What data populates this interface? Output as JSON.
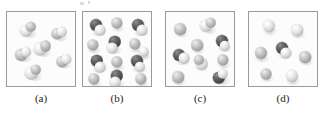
{
  "figure": {
    "width": 323,
    "height": 113,
    "background": "#ffffff",
    "border_color": "#9a9a9a",
    "panel_background": "#fcfcfc",
    "atom_colors": {
      "light": "#e8e8e8",
      "gray": "#b6b6b6",
      "dark": "#4e4e4e"
    },
    "top_artifact": "cut-off text remnant"
  },
  "panels": [
    {
      "id": "panel-a",
      "label": "(a)",
      "x": 6,
      "y": 11,
      "w": 70,
      "h": 76,
      "label_x": 6,
      "label_w": 70,
      "label_y": 92,
      "molecules": [
        {
          "type": "diatomic-light-light",
          "atoms": [
            {
              "cx": 19,
              "cy": 19,
              "r": 6.2,
              "shade": "light"
            },
            {
              "cx": 23.5,
              "cy": 15,
              "r": 5.2,
              "shade": "gray"
            }
          ]
        },
        {
          "type": "diatomic-light-light",
          "atoms": [
            {
              "cx": 50,
              "cy": 22,
              "r": 5.6,
              "shade": "gray"
            },
            {
              "cx": 55,
              "cy": 20,
              "r": 5.2,
              "shade": "light"
            }
          ]
        },
        {
          "type": "diatomic-light-light",
          "atoms": [
            {
              "cx": 14,
              "cy": 43,
              "r": 6.0,
              "shade": "gray"
            },
            {
              "cx": 19,
              "cy": 40,
              "r": 5.0,
              "shade": "light"
            }
          ]
        },
        {
          "type": "diatomic-light-light",
          "atoms": [
            {
              "cx": 33,
              "cy": 37,
              "r": 6.4,
              "shade": "light"
            },
            {
              "cx": 38.5,
              "cy": 34,
              "r": 5.4,
              "shade": "gray"
            }
          ]
        },
        {
          "type": "diatomic-light-light",
          "atoms": [
            {
              "cx": 55,
              "cy": 50,
              "r": 5.6,
              "shade": "gray"
            },
            {
              "cx": 59,
              "cy": 47,
              "r": 4.8,
              "shade": "light"
            }
          ]
        },
        {
          "type": "diatomic-light-light",
          "atoms": [
            {
              "cx": 24,
              "cy": 61,
              "r": 6.4,
              "shade": "light"
            },
            {
              "cx": 29,
              "cy": 58,
              "r": 5.2,
              "shade": "gray"
            }
          ]
        }
      ]
    },
    {
      "id": "panel-b",
      "label": "(b)",
      "x": 82,
      "y": 11,
      "w": 70,
      "h": 76,
      "label_x": 82,
      "label_w": 70,
      "label_y": 92,
      "molecules": [
        {
          "type": "diatomic-dark-light",
          "atoms": [
            {
              "cx": 13,
              "cy": 13,
              "r": 6.0,
              "shade": "dark"
            },
            {
              "cx": 17,
              "cy": 18,
              "r": 5.4,
              "shade": "light"
            }
          ]
        },
        {
          "type": "monatomic-light",
          "atoms": [
            {
              "cx": 34,
              "cy": 11,
              "r": 5.6,
              "shade": "gray"
            }
          ]
        },
        {
          "type": "diatomic-dark-light",
          "atoms": [
            {
              "cx": 55,
              "cy": 13,
              "r": 6.0,
              "shade": "dark"
            },
            {
              "cx": 59,
              "cy": 18,
              "r": 5.4,
              "shade": "light"
            }
          ]
        },
        {
          "type": "monatomic-light",
          "atoms": [
            {
              "cx": 10,
              "cy": 33,
              "r": 5.6,
              "shade": "gray"
            }
          ]
        },
        {
          "type": "diatomic-dark-light",
          "atoms": [
            {
              "cx": 32,
              "cy": 30,
              "r": 6.2,
              "shade": "dark"
            },
            {
              "cx": 29,
              "cy": 36,
              "r": 5.4,
              "shade": "light"
            }
          ]
        },
        {
          "type": "monatomic-light",
          "atoms": [
            {
              "cx": 52,
              "cy": 32,
              "r": 5.6,
              "shade": "gray"
            }
          ]
        },
        {
          "type": "monatomic-light",
          "atoms": [
            {
              "cx": 61,
              "cy": 40,
              "r": 5.2,
              "shade": "light"
            }
          ]
        },
        {
          "type": "diatomic-dark-light",
          "atoms": [
            {
              "cx": 14,
              "cy": 49,
              "r": 6.2,
              "shade": "dark"
            },
            {
              "cx": 17,
              "cy": 55,
              "r": 5.4,
              "shade": "light"
            }
          ]
        },
        {
          "type": "monatomic-light",
          "atoms": [
            {
              "cx": 34,
              "cy": 50,
              "r": 5.6,
              "shade": "gray"
            }
          ]
        },
        {
          "type": "diatomic-dark-light",
          "atoms": [
            {
              "cx": 54,
              "cy": 49,
              "r": 6.0,
              "shade": "dark"
            },
            {
              "cx": 57,
              "cy": 55,
              "r": 5.2,
              "shade": "light"
            }
          ]
        },
        {
          "type": "diatomic-dark-light",
          "atoms": [
            {
              "cx": 34,
              "cy": 64,
              "r": 6.2,
              "shade": "dark"
            },
            {
              "cx": 32,
              "cy": 70,
              "r": 5.4,
              "shade": "light"
            }
          ]
        },
        {
          "type": "monatomic-light",
          "atoms": [
            {
              "cx": 11,
              "cy": 67,
              "r": 5.6,
              "shade": "gray"
            }
          ]
        },
        {
          "type": "monatomic-light",
          "atoms": [
            {
              "cx": 58,
              "cy": 67,
              "r": 5.6,
              "shade": "gray"
            }
          ]
        }
      ]
    },
    {
      "id": "panel-c",
      "label": "(c)",
      "x": 165,
      "y": 11,
      "w": 70,
      "h": 76,
      "label_x": 165,
      "label_w": 70,
      "label_y": 92,
      "molecules": [
        {
          "type": "monatomic-light",
          "atoms": [
            {
              "cx": 14,
              "cy": 17,
              "r": 5.8,
              "shade": "gray"
            }
          ]
        },
        {
          "type": "diatomic-light-light",
          "atoms": [
            {
              "cx": 40,
              "cy": 14,
              "r": 6.2,
              "shade": "light"
            },
            {
              "cx": 45,
              "cy": 11,
              "r": 5.2,
              "shade": "gray"
            }
          ]
        },
        {
          "type": "monatomic-light",
          "atoms": [
            {
              "cx": 31,
              "cy": 33,
              "r": 5.8,
              "shade": "gray"
            }
          ]
        },
        {
          "type": "diatomic-dark-light",
          "atoms": [
            {
              "cx": 56,
              "cy": 29,
              "r": 6.0,
              "shade": "dark"
            },
            {
              "cx": 59,
              "cy": 34,
              "r": 5.2,
              "shade": "light"
            }
          ]
        },
        {
          "type": "diatomic-dark-light",
          "atoms": [
            {
              "cx": 13,
              "cy": 43,
              "r": 6.0,
              "shade": "dark"
            },
            {
              "cx": 18,
              "cy": 46,
              "r": 5.4,
              "shade": "light"
            }
          ]
        },
        {
          "type": "diatomic-light-light",
          "atoms": [
            {
              "cx": 36,
              "cy": 52,
              "r": 6.2,
              "shade": "light"
            },
            {
              "cx": 33,
              "cy": 48,
              "r": 5.0,
              "shade": "gray"
            }
          ]
        },
        {
          "type": "monatomic-light",
          "atoms": [
            {
              "cx": 57,
              "cy": 48,
              "r": 5.6,
              "shade": "gray"
            }
          ]
        },
        {
          "type": "monatomic-light",
          "atoms": [
            {
              "cx": 12,
              "cy": 65,
              "r": 5.8,
              "shade": "gray"
            }
          ]
        },
        {
          "type": "diatomic-dark-light",
          "atoms": [
            {
              "cx": 53,
              "cy": 66,
              "r": 6.2,
              "shade": "dark"
            },
            {
              "cx": 57,
              "cy": 62,
              "r": 5.2,
              "shade": "light"
            }
          ]
        }
      ]
    },
    {
      "id": "panel-d",
      "label": "(d)",
      "x": 248,
      "y": 11,
      "w": 70,
      "h": 76,
      "label_x": 248,
      "label_w": 70,
      "label_y": 92,
      "molecules": [
        {
          "type": "monatomic-light",
          "atoms": [
            {
              "cx": 20,
              "cy": 14,
              "r": 6.0,
              "shade": "light"
            }
          ]
        },
        {
          "type": "monatomic-light",
          "atoms": [
            {
              "cx": 48,
              "cy": 18,
              "r": 5.8,
              "shade": "light"
            }
          ]
        },
        {
          "type": "monatomic-light",
          "atoms": [
            {
              "cx": 12,
              "cy": 41,
              "r": 6.0,
              "shade": "gray"
            }
          ]
        },
        {
          "type": "diatomic-dark-light",
          "atoms": [
            {
              "cx": 33,
              "cy": 36,
              "r": 6.0,
              "shade": "dark"
            },
            {
              "cx": 37,
              "cy": 41,
              "r": 5.6,
              "shade": "light"
            }
          ]
        },
        {
          "type": "monatomic-light",
          "atoms": [
            {
              "cx": 56,
              "cy": 45,
              "r": 5.8,
              "shade": "gray"
            }
          ]
        },
        {
          "type": "monatomic-light",
          "atoms": [
            {
              "cx": 17,
              "cy": 62,
              "r": 5.4,
              "shade": "gray"
            }
          ]
        },
        {
          "type": "monatomic-light",
          "atoms": [
            {
              "cx": 43,
              "cy": 64,
              "r": 6.0,
              "shade": "light"
            }
          ]
        }
      ]
    }
  ]
}
